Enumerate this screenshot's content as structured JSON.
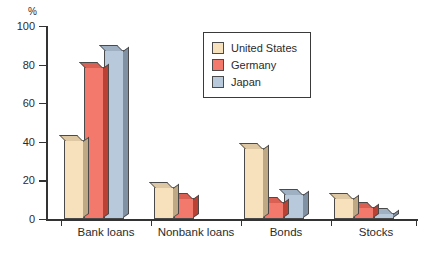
{
  "chart_data": {
    "type": "bar",
    "title": "",
    "subtitle": "",
    "xlabel": "",
    "ylabel": "%",
    "ylim": [
      0,
      100
    ],
    "yticks": [
      0,
      20,
      40,
      60,
      80,
      100
    ],
    "grid": false,
    "legend_position": "top-center",
    "categories": [
      "Bank loans",
      "Nonbank loans",
      "Bonds",
      "Stocks"
    ],
    "series": [
      {
        "name": "United States",
        "color": "#f7e0bc",
        "values": [
          41,
          16.5,
          37,
          11
        ]
      },
      {
        "name": "Germany",
        "color": "#f2796b",
        "values": [
          79,
          11,
          9,
          6
        ]
      },
      {
        "name": "Japan",
        "color": "#b9c9dc",
        "values": [
          87.5,
          0,
          13,
          3
        ]
      }
    ],
    "annotations": []
  },
  "axis": {
    "unit_label": "%",
    "tick_labels": [
      "100",
      "80",
      "60",
      "40",
      "20",
      "0"
    ]
  },
  "legend": {
    "items": [
      {
        "label": "United States"
      },
      {
        "label": "Germany"
      },
      {
        "label": "Japan"
      }
    ]
  }
}
